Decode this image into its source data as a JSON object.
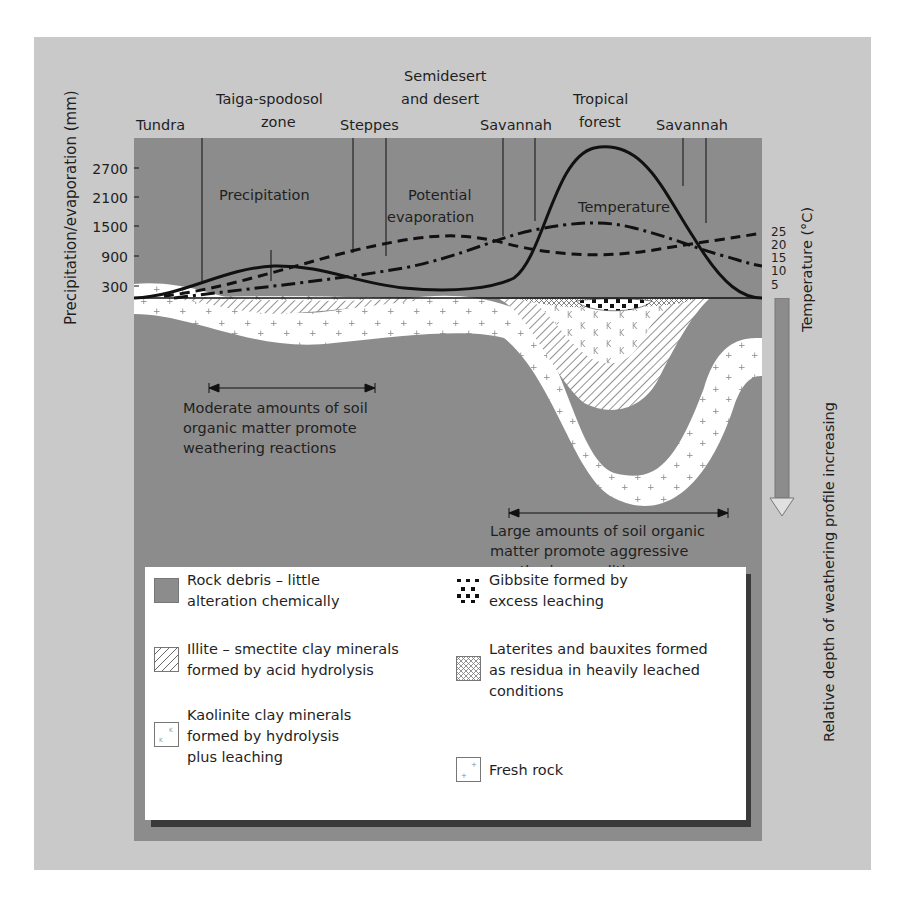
{
  "figure": {
    "zones": [
      {
        "label_lines": [
          "Tundra"
        ],
        "x": 168
      },
      {
        "label_lines": [
          "Taiga-spodosol",
          "zone"
        ],
        "x": 282
      },
      {
        "label_lines": [
          "Steppes"
        ],
        "x": 374
      },
      {
        "label_lines": [
          "Semidesert",
          "and desert"
        ],
        "x": 449
      },
      {
        "label_lines": [
          "Savannah"
        ],
        "x": 515
      },
      {
        "label_lines": [
          "Tropical",
          "forest"
        ],
        "x": 601
      },
      {
        "label_lines": [
          "Savannah"
        ],
        "x": 696
      }
    ],
    "left_axis": {
      "title": "Precipitation/evaporation (mm)",
      "ticks": [
        "2700",
        "2100",
        "1500",
        "900",
        "300"
      ]
    },
    "right_axis": {
      "title": "Temperature (°C)",
      "ticks": [
        "25",
        "20",
        "15",
        "10",
        "5"
      ]
    },
    "depth_axis": {
      "title": "Relative depth of weathering profile increasing"
    },
    "curve_labels": {
      "precipitation": "Precipitation",
      "evaporation_line1": "Potential",
      "evaporation_line2": "evaporation",
      "temperature": "Temperature"
    },
    "annotations": {
      "moderate": [
        "Moderate amounts of soil",
        "organic matter promote",
        "weathering reactions"
      ],
      "large": [
        "Large amounts of soil organic",
        "matter promote aggressive",
        "weathering conditions"
      ]
    },
    "colors": {
      "outer_bg": "#c9c9c9",
      "rock_debris": "#8c8c8c",
      "fresh_rock": "#ffffff",
      "line": "#111111"
    },
    "legend": [
      {
        "pattern": "rock-debris",
        "lines": [
          "Rock debris – little",
          "alteration chemically"
        ]
      },
      {
        "pattern": "illite",
        "lines": [
          "Illite – smectite clay minerals",
          "formed by acid hydrolysis"
        ]
      },
      {
        "pattern": "kaolinite",
        "lines": [
          "Kaolinite clay minerals",
          "formed by hydrolysis",
          "plus leaching"
        ]
      },
      {
        "pattern": "gibbsite",
        "lines": [
          "Gibbsite formed by",
          "excess leaching"
        ]
      },
      {
        "pattern": "laterite",
        "lines": [
          "Laterites and bauxites formed",
          "as residua in heavily leached",
          "conditions"
        ]
      },
      {
        "pattern": "fresh-rock",
        "lines": [
          "Fresh rock"
        ]
      }
    ]
  },
  "text": {
    "z0": "Tundra",
    "z1a": "Taiga-spodosol",
    "z1b": "zone",
    "z2": "Steppes",
    "z3a": "Semidesert",
    "z3b": "and desert",
    "z4": "Savannah",
    "z5a": "Tropical",
    "z5b": "forest",
    "z6": "Savannah",
    "yl": "Precipitation/evaporation (mm)",
    "yt": [
      "2700",
      "2100",
      "1500",
      "900",
      "300"
    ],
    "tr": "Temperature (°C)",
    "tt": [
      "25",
      "20",
      "15",
      "10",
      "5"
    ],
    "depth": "Relative depth of weathering profile increasing",
    "precip": "Precipitation",
    "evap1": "Potential",
    "evap2": "evaporation",
    "temp": "Temperature",
    "mod1": "Moderate amounts of soil",
    "mod2": "organic matter promote",
    "mod3": "weathering reactions",
    "lg1": "Large amounts of soil organic",
    "lg2": "matter promote aggressive",
    "lg3": "weathering conditions",
    "leg0": "Rock debris – little\nalteration chemically",
    "leg1": "Illite – smectite clay minerals\nformed by acid hydrolysis",
    "leg2": "Kaolinite clay minerals\nformed by hydrolysis\nplus leaching",
    "leg3": "Gibbsite formed by\nexcess leaching",
    "leg4": "Laterites and bauxites formed\nas residua in heavily leached\nconditions",
    "leg5": "Fresh rock"
  }
}
